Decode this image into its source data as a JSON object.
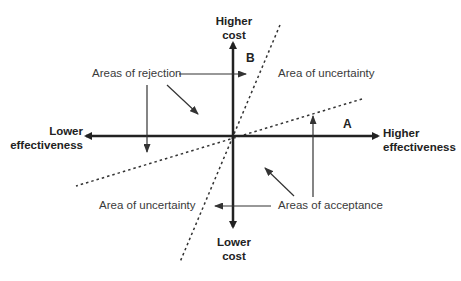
{
  "diagram": {
    "type": "cost-effectiveness plane",
    "axes": {
      "y_top": {
        "line1": "Higher",
        "line2": "cost"
      },
      "y_bottom": {
        "line1": "Lower",
        "line2": "cost"
      },
      "x_left": {
        "line1": "Lower",
        "line2": "effectiveness"
      },
      "x_right": {
        "line1": "Higher",
        "line2": "effectiveness"
      }
    },
    "threshold_lines": {
      "A": {
        "label": "A",
        "style": "dashed",
        "slope": "shallow"
      },
      "B": {
        "label": "B",
        "style": "dashed",
        "slope": "steep"
      }
    },
    "regions": {
      "rejection": "Areas of rejection",
      "uncertainty_upper_right": "Area of uncertainty",
      "uncertainty_lower_left": "Area of uncertainty",
      "acceptance": "Areas of acceptance"
    },
    "colors": {
      "axis": "#222222",
      "text": "#3a3a3a",
      "background": "#ffffff"
    }
  }
}
